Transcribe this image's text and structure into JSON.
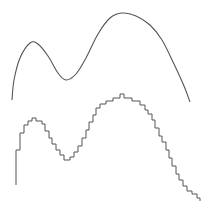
{
  "figure": {
    "width": 204,
    "height": 209,
    "background": "#ffffff",
    "stroke_color": "#555555"
  },
  "smooth_curve": {
    "label": "",
    "points": [
      [
        12,
        100
      ],
      [
        14,
        80
      ],
      [
        20,
        58
      ],
      [
        30,
        43
      ],
      [
        38,
        44
      ],
      [
        48,
        56
      ],
      [
        58,
        73
      ],
      [
        66,
        80
      ],
      [
        76,
        74
      ],
      [
        86,
        58
      ],
      [
        98,
        34
      ],
      [
        110,
        18
      ],
      [
        122,
        13
      ],
      [
        136,
        16
      ],
      [
        150,
        25
      ],
      [
        162,
        40
      ],
      [
        174,
        64
      ],
      [
        184,
        86
      ],
      [
        190,
        102
      ]
    ]
  },
  "step_curve": {
    "label": "",
    "start": [
      16,
      185
    ],
    "points": [
      [
        16,
        150
      ],
      [
        20,
        150
      ],
      [
        20,
        133
      ],
      [
        24,
        133
      ],
      [
        24,
        125
      ],
      [
        28,
        125
      ],
      [
        28,
        121
      ],
      [
        32,
        121
      ],
      [
        32,
        118
      ],
      [
        36,
        118
      ],
      [
        36,
        121
      ],
      [
        42,
        121
      ],
      [
        42,
        124
      ],
      [
        45,
        124
      ],
      [
        45,
        131
      ],
      [
        49,
        131
      ],
      [
        49,
        138
      ],
      [
        52,
        138
      ],
      [
        52,
        144
      ],
      [
        56,
        144
      ],
      [
        56,
        150
      ],
      [
        60,
        150
      ],
      [
        60,
        155
      ],
      [
        64,
        155
      ],
      [
        64,
        160
      ],
      [
        70,
        160
      ],
      [
        70,
        157
      ],
      [
        74,
        157
      ],
      [
        74,
        152
      ],
      [
        78,
        152
      ],
      [
        78,
        146
      ],
      [
        82,
        146
      ],
      [
        82,
        138
      ],
      [
        86,
        138
      ],
      [
        86,
        130
      ],
      [
        89,
        130
      ],
      [
        89,
        122
      ],
      [
        93,
        122
      ],
      [
        93,
        115
      ],
      [
        96,
        115
      ],
      [
        96,
        108
      ],
      [
        100,
        108
      ],
      [
        100,
        104
      ],
      [
        106,
        104
      ],
      [
        106,
        101
      ],
      [
        113,
        101
      ],
      [
        113,
        98
      ],
      [
        120,
        98
      ],
      [
        120,
        94
      ],
      [
        124,
        94
      ],
      [
        124,
        98
      ],
      [
        132,
        98
      ],
      [
        132,
        101
      ],
      [
        140,
        101
      ],
      [
        140,
        105
      ],
      [
        145,
        105
      ],
      [
        145,
        110
      ],
      [
        148,
        110
      ],
      [
        148,
        114
      ],
      [
        152,
        114
      ],
      [
        152,
        120
      ],
      [
        155,
        120
      ],
      [
        155,
        128
      ],
      [
        159,
        128
      ],
      [
        159,
        136
      ],
      [
        162,
        136
      ],
      [
        162,
        142
      ],
      [
        166,
        142
      ],
      [
        166,
        150
      ],
      [
        169,
        150
      ],
      [
        169,
        158
      ],
      [
        172,
        158
      ],
      [
        172,
        166
      ],
      [
        176,
        166
      ],
      [
        176,
        174
      ],
      [
        179,
        174
      ],
      [
        179,
        180
      ],
      [
        183,
        180
      ],
      [
        183,
        186
      ],
      [
        187,
        186
      ],
      [
        187,
        191
      ],
      [
        192,
        191
      ],
      [
        192,
        194
      ],
      [
        197,
        194
      ],
      [
        197,
        198
      ],
      [
        200,
        198
      ],
      [
        200,
        201
      ]
    ]
  }
}
